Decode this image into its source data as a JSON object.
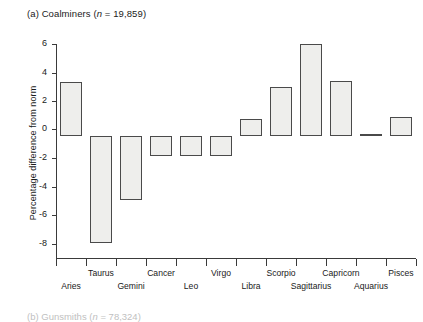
{
  "figure": {
    "caption_prefix": "(a) Coalminers (",
    "caption_italic_n": "n",
    "caption_suffix": " = 19,859)",
    "next_caption_prefix": "(b) Gunsmiths (",
    "next_caption_italic_n": "n",
    "next_caption_suffix": " = 78,324)"
  },
  "axes": {
    "y_title": "Percentage difference from norm",
    "y_ticks": [
      "6",
      "4",
      "2",
      "0",
      "-2",
      "-4",
      "-6",
      "-8"
    ],
    "y_min": -8,
    "y_max": 6,
    "y_step": 2,
    "x_title": ""
  },
  "colors": {
    "bar_fill": "#eeeeec",
    "bar_stroke": "#4a4a4a",
    "axis": "#3a3a3a",
    "text": "#1a1a1a",
    "background": "#ffffff"
  },
  "chart_data": {
    "type": "bar",
    "title": "(a) Coalminers (n = 19,859)",
    "xlabel": "",
    "ylabel": "Percentage difference from norm",
    "ylim": [
      -8,
      6
    ],
    "yticks": [
      -8,
      -6,
      -4,
      -2,
      0,
      2,
      4,
      6
    ],
    "grid": false,
    "legend": "none",
    "categories": [
      "Aries",
      "Taurus",
      "Gemini",
      "Cancer",
      "Leo",
      "Virgo",
      "Libra",
      "Scorpio",
      "Sagittarius",
      "Capricorn",
      "Aquarius",
      "Pisces"
    ],
    "values": [
      3.5,
      -7.0,
      -4.2,
      -1.3,
      -1.3,
      -1.3,
      1.1,
      3.2,
      6.0,
      3.6,
      0.1,
      1.2
    ]
  }
}
